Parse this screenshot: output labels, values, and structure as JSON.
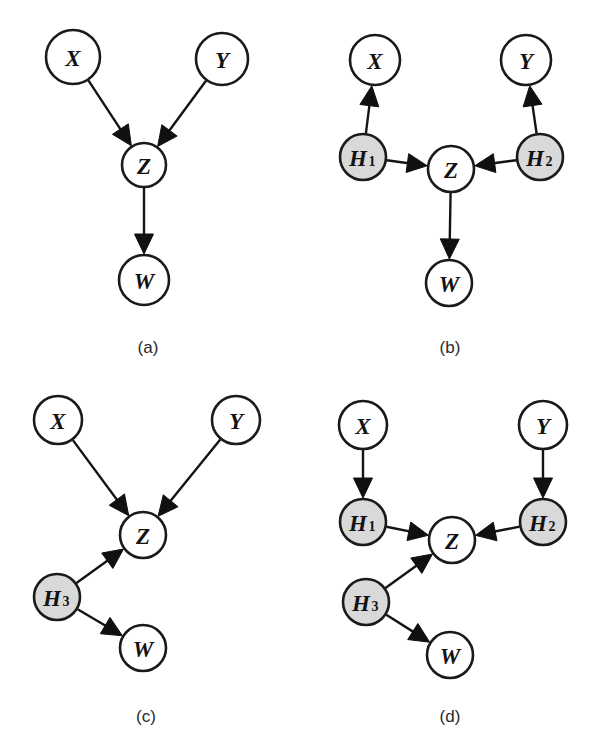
{
  "figure": {
    "width": 593,
    "height": 753,
    "background": "#ffffff",
    "node_fill_observed": "#ffffff",
    "node_fill_hidden": "#d9d9d9",
    "stroke_color": "#1a1a1a"
  },
  "panels": [
    {
      "id": "a",
      "caption": "(a)",
      "caption_x": 148,
      "caption_y": 347,
      "nodes": [
        {
          "id": "X",
          "label": "X",
          "sub": "",
          "x": 73,
          "y": 57,
          "r": 27,
          "shaded": false
        },
        {
          "id": "Y",
          "label": "Y",
          "sub": "",
          "x": 222,
          "y": 59,
          "r": 26,
          "shaded": false
        },
        {
          "id": "Z",
          "label": "Z",
          "sub": "",
          "x": 144,
          "y": 165,
          "r": 22,
          "shaded": false
        },
        {
          "id": "W",
          "label": "W",
          "sub": "",
          "x": 144,
          "y": 280,
          "r": 25,
          "shaded": false
        }
      ],
      "edges": [
        {
          "from": "X",
          "to": "Z"
        },
        {
          "from": "Y",
          "to": "Z"
        },
        {
          "from": "Z",
          "to": "W"
        }
      ]
    },
    {
      "id": "b",
      "caption": "(b)",
      "caption_x": 450,
      "caption_y": 347,
      "nodes": [
        {
          "id": "X",
          "label": "X",
          "sub": "",
          "x": 375,
          "y": 60,
          "r": 25,
          "shaded": false
        },
        {
          "id": "Y",
          "label": "Y",
          "sub": "",
          "x": 526,
          "y": 60,
          "r": 25,
          "shaded": false
        },
        {
          "id": "H1",
          "label": "H",
          "sub": "1",
          "x": 363,
          "y": 157,
          "r": 23,
          "shaded": true
        },
        {
          "id": "Z",
          "label": "Z",
          "sub": "",
          "x": 451,
          "y": 169,
          "r": 23,
          "shaded": false
        },
        {
          "id": "H2",
          "label": "H",
          "sub": "2",
          "x": 540,
          "y": 157,
          "r": 23,
          "shaded": true
        },
        {
          "id": "W",
          "label": "W",
          "sub": "",
          "x": 449,
          "y": 283,
          "r": 23,
          "shaded": false
        }
      ],
      "edges": [
        {
          "from": "H1",
          "to": "X"
        },
        {
          "from": "H1",
          "to": "Z"
        },
        {
          "from": "H2",
          "to": "Y"
        },
        {
          "from": "H2",
          "to": "Z"
        },
        {
          "from": "Z",
          "to": "W"
        }
      ]
    },
    {
      "id": "c",
      "caption": "(c)",
      "caption_x": 146,
      "caption_y": 716,
      "nodes": [
        {
          "id": "X",
          "label": "X",
          "sub": "",
          "x": 58,
          "y": 420,
          "r": 24,
          "shaded": false
        },
        {
          "id": "Y",
          "label": "Y",
          "sub": "",
          "x": 236,
          "y": 420,
          "r": 24,
          "shaded": false
        },
        {
          "id": "Z",
          "label": "Z",
          "sub": "",
          "x": 143,
          "y": 535,
          "r": 23,
          "shaded": false
        },
        {
          "id": "H3",
          "label": "H",
          "sub": "3",
          "x": 57,
          "y": 597,
          "r": 23,
          "shaded": true
        },
        {
          "id": "W",
          "label": "W",
          "sub": "",
          "x": 143,
          "y": 648,
          "r": 23,
          "shaded": false
        }
      ],
      "edges": [
        {
          "from": "X",
          "to": "Z"
        },
        {
          "from": "Y",
          "to": "Z"
        },
        {
          "from": "H3",
          "to": "Z"
        },
        {
          "from": "H3",
          "to": "W"
        }
      ]
    },
    {
      "id": "d",
      "caption": "(d)",
      "caption_x": 450,
      "caption_y": 716,
      "nodes": [
        {
          "id": "X",
          "label": "X",
          "sub": "",
          "x": 363,
          "y": 425,
          "r": 24,
          "shaded": false
        },
        {
          "id": "Y",
          "label": "Y",
          "sub": "",
          "x": 543,
          "y": 425,
          "r": 24,
          "shaded": false
        },
        {
          "id": "H1",
          "label": "H",
          "sub": "1",
          "x": 363,
          "y": 522,
          "r": 23,
          "shaded": true
        },
        {
          "id": "Z",
          "label": "Z",
          "sub": "",
          "x": 452,
          "y": 540,
          "r": 23,
          "shaded": false
        },
        {
          "id": "H2",
          "label": "H",
          "sub": "2",
          "x": 543,
          "y": 522,
          "r": 23,
          "shaded": true
        },
        {
          "id": "H3",
          "label": "H",
          "sub": "3",
          "x": 366,
          "y": 602,
          "r": 23,
          "shaded": true
        },
        {
          "id": "W",
          "label": "W",
          "sub": "",
          "x": 450,
          "y": 655,
          "r": 23,
          "shaded": false
        }
      ],
      "edges": [
        {
          "from": "X",
          "to": "H1"
        },
        {
          "from": "Y",
          "to": "H2"
        },
        {
          "from": "H1",
          "to": "Z"
        },
        {
          "from": "H2",
          "to": "Z"
        },
        {
          "from": "H3",
          "to": "Z"
        },
        {
          "from": "H3",
          "to": "W"
        }
      ]
    }
  ]
}
